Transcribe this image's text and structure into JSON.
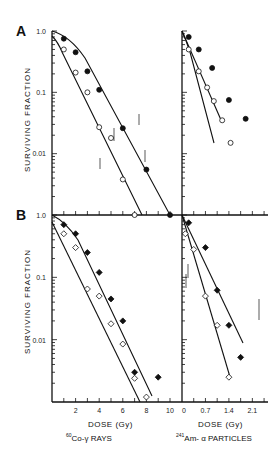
{
  "figure": {
    "panel_labels": [
      "A",
      "B"
    ],
    "ylabel": "SURVIVING   FRACTION",
    "left_xlabel": "DOSE (Gy)",
    "left_source": "60Co-γ RAYS",
    "left_source_sup": "60",
    "left_source_text": "Co-γ RAYS",
    "right_xlabel": "DOSE (Gy)",
    "right_source_sup": "241",
    "right_source_text": "Am- α PARTICLES",
    "y_ticks": [
      "1.0",
      "0.1",
      "0.01"
    ],
    "y_ticks_b": [
      "1.0",
      "0.1",
      "0.01"
    ],
    "left_x_ticks": [
      "2",
      "4",
      "6",
      "8",
      "10"
    ],
    "right_x_ticks": [
      "0",
      "0.7",
      "1.4",
      "2.1"
    ],
    "colors": {
      "axis": "#111111",
      "filled": "#111111",
      "open": "#ffffff"
    }
  },
  "chart_data": [
    {
      "type": "scatter",
      "panel": "A-left",
      "title": "A: 60Co-γ rays",
      "xlabel": "DOSE (Gy)",
      "ylabel": "SURVIVING FRACTION",
      "yscale": "log",
      "ylim": [
        0.001,
        1.0
      ],
      "xlim": [
        0,
        10
      ],
      "series": [
        {
          "name": "filled",
          "marker": "filled-circle",
          "x": [
            1,
            2,
            3,
            4,
            6,
            8,
            10
          ],
          "y": [
            0.75,
            0.45,
            0.22,
            0.11,
            0.026,
            0.0055,
            0.001
          ]
        },
        {
          "name": "open",
          "marker": "open-circle",
          "x": [
            1,
            2,
            3,
            4,
            5,
            6,
            7
          ],
          "y": [
            0.5,
            0.21,
            0.1,
            0.027,
            0.018,
            0.0038,
            0.001
          ]
        }
      ]
    },
    {
      "type": "scatter",
      "panel": "A-right",
      "title": "A: 241Am-α particles",
      "xlabel": "DOSE (Gy)",
      "yscale": "log",
      "ylim": [
        0.001,
        1.0
      ],
      "xlim": [
        0,
        2.6
      ],
      "series": [
        {
          "name": "filled",
          "marker": "filled-circle",
          "x": [
            0.2,
            0.5,
            0.9,
            1.4,
            1.9
          ],
          "y": [
            0.8,
            0.5,
            0.25,
            0.075,
            0.037
          ]
        },
        {
          "name": "open",
          "marker": "open-circle",
          "x": [
            0.2,
            0.5,
            0.75,
            0.95,
            1.2,
            1.45
          ],
          "y": [
            0.5,
            0.22,
            0.12,
            0.072,
            0.035,
            0.015
          ]
        }
      ]
    },
    {
      "type": "scatter",
      "panel": "B-left",
      "title": "B: 60Co-γ rays",
      "xlabel": "DOSE (Gy)",
      "ylabel": "SURVIVING FRACTION",
      "yscale": "log",
      "ylim": [
        0.001,
        1.0
      ],
      "xlim": [
        0,
        11
      ],
      "series": [
        {
          "name": "filled",
          "marker": "filled-diamond",
          "x": [
            1,
            2,
            3,
            4,
            5,
            6,
            7,
            9
          ],
          "y": [
            0.7,
            0.5,
            0.25,
            0.12,
            0.045,
            0.02,
            0.003,
            0.0025
          ]
        },
        {
          "name": "open",
          "marker": "open-diamond",
          "x": [
            1,
            2,
            3,
            4,
            5,
            6,
            7,
            8
          ],
          "y": [
            0.5,
            0.3,
            0.065,
            0.05,
            0.018,
            0.0085,
            0.0024,
            0.0012
          ]
        }
      ]
    },
    {
      "type": "scatter",
      "panel": "B-right",
      "title": "B: 241Am-α particles",
      "xlabel": "DOSE (Gy)",
      "yscale": "log",
      "ylim": [
        0.001,
        1.0
      ],
      "xlim": [
        0,
        2.6
      ],
      "x_ticks": [
        0,
        0.7,
        1.4,
        2.1
      ],
      "series": [
        {
          "name": "filled",
          "marker": "filled-diamond",
          "x": [
            0.2,
            0.7,
            1.05,
            1.4,
            1.75
          ],
          "y": [
            0.75,
            0.3,
            0.062,
            0.017,
            0.0052
          ]
        },
        {
          "name": "open",
          "marker": "open-diamond",
          "x": [
            0.1,
            0.35,
            0.7,
            1.05,
            1.4
          ],
          "y": [
            0.5,
            0.28,
            0.05,
            0.017,
            0.0025
          ]
        }
      ]
    }
  ]
}
